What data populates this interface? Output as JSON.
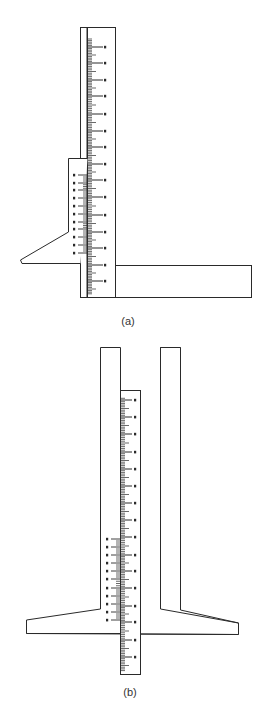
{
  "figure": {
    "panels": [
      {
        "id": "a",
        "label": "(a)",
        "description": "Vernier depth gauge with slider and angled blade, base bar extending right",
        "main_scale": {
          "x": 87,
          "y_top": 27,
          "width": 29,
          "y_bottom": 298,
          "major_tick_y": [
            47,
            63,
            80,
            96,
            114,
            131,
            147,
            164,
            180,
            197,
            215,
            232,
            248,
            265,
            281
          ],
          "major_tick_labels": [
            "",
            "",
            "",
            "",
            "",
            "",
            "",
            "",
            "",
            "",
            "",
            "",
            "",
            "",
            ""
          ]
        },
        "vernier": {
          "x": 68,
          "y_top": 158,
          "width": 19,
          "y_bottom": 263,
          "tick_y": [
            175,
            183,
            190,
            198,
            206,
            214,
            222,
            229,
            237,
            245,
            253
          ],
          "tick_labels": [
            "",
            "",
            "",
            "",
            "",
            "",
            "",
            "",
            "",
            "",
            ""
          ]
        },
        "blade": {
          "points": [
            [
              68,
              232
            ],
            [
              20,
              262
            ],
            [
              22,
              263
            ],
            [
              68,
              263
            ]
          ]
        },
        "base_bar": {
          "x": 115,
          "y": 265,
          "width": 137,
          "height": 33
        }
      },
      {
        "id": "b",
        "label": "(b)",
        "description": "Depth gauge with sliding scale between two columns and T-shaped base",
        "main_scale": {
          "x": 120,
          "y_top": 390,
          "width": 20,
          "y_bottom": 675,
          "major_tick_y": [
            400,
            417,
            434,
            452,
            469,
            486,
            503,
            520,
            537,
            555,
            571,
            588,
            606,
            622,
            640,
            657
          ],
          "major_tick_labels": [
            "",
            "",
            "",
            "",
            "",
            "",
            "",
            "",
            "",
            "",
            "",
            "",
            "",
            "",
            "",
            ""
          ]
        },
        "vernier": {
          "x": 110,
          "y_top": 538,
          "y_bottom": 622,
          "tick_y": [
            539,
            547,
            555,
            563,
            571,
            579,
            588,
            596,
            604,
            612,
            620
          ],
          "tick_labels": [
            "",
            "",
            "",
            "",
            "",
            "",
            "",
            "",
            "",
            "",
            ""
          ]
        },
        "left_column": {
          "x": 100,
          "y": 347,
          "width": 20
        },
        "right_column": {
          "x": 160,
          "y": 347,
          "width": 20
        }
      }
    ],
    "colors": {
      "line": "#2a2a2a",
      "background": "#ffffff"
    }
  }
}
